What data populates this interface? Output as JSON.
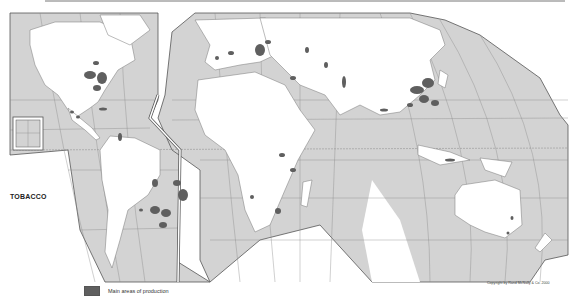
{
  "map": {
    "title": "TOBACCO",
    "legend": [
      {
        "label": "Main areas of production",
        "color": "#5f5f5f"
      }
    ],
    "copyright": "Copyright by Rand McNally & Co. 2000",
    "colors": {
      "ocean": "#d3d3d3",
      "land": "#ffffff",
      "production": "#5f5f5f",
      "graticule": "#777777",
      "border": "#555555"
    },
    "production_regions": [
      "Eastern United States",
      "Mexico",
      "Caribbean",
      "Brazil",
      "Argentina",
      "Southern Europe / Balkans",
      "Turkey",
      "Central Asia",
      "India",
      "China",
      "Southeast Asia",
      "Indonesia",
      "East Africa",
      "Southern Africa",
      "Australia"
    ]
  }
}
